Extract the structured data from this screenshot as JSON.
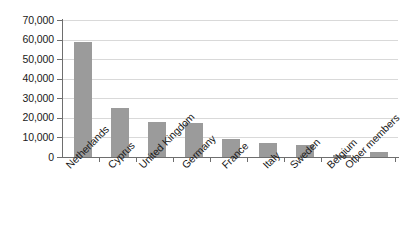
{
  "chart_data": {
    "type": "bar",
    "title": "",
    "subtitle": "",
    "xlabel": "",
    "ylabel": "",
    "categories": [
      "Netherlands",
      "Cyprus",
      "United Kingdom",
      "Germany",
      "France",
      "Italy",
      "Sweden",
      "Belgium",
      "Other members"
    ],
    "values": [
      58800,
      25200,
      17700,
      17200,
      9300,
      7200,
      6200,
      1100,
      2700
    ],
    "ylim": [
      0,
      70000
    ],
    "ytick_values": [
      70000,
      60000,
      50000,
      40000,
      30000,
      20000,
      10000,
      0
    ],
    "ytick_labels": [
      "70,000",
      "60,000",
      "50,000",
      "40,000",
      "30,000",
      "20,000",
      "10,000",
      "0"
    ],
    "grid": true,
    "grid_axis": "y",
    "legend": false,
    "legend_position": "none",
    "series": [
      {
        "name": "",
        "values": [
          58800,
          25200,
          17700,
          17200,
          9300,
          7200,
          6200,
          1100,
          2700
        ]
      }
    ]
  },
  "style": {
    "bar_color": "#9b9b9b",
    "grid_color": "#d9d9d9",
    "axis_color": "#6e6e6e",
    "text_color": "#1a1a1a",
    "background": "#ffffff"
  }
}
